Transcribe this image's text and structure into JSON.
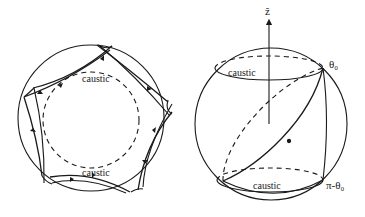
{
  "figure": {
    "left_panel": {
      "description": "Circular billiard with pentagram-like orbit and circular caustic",
      "labels": {
        "caustic_top": "caustic",
        "caustic_bottom": "caustic"
      }
    },
    "right_panel": {
      "description": "Sphere with great-circle orbit between two latitude caustics",
      "labels": {
        "axis": "ẑ",
        "theta_top": "θ₀",
        "caustic_top": "caustic",
        "caustic_bottom": "caustic",
        "theta_bottom": "π-θ₀"
      }
    },
    "colors": {
      "stroke": "#1a1a1a",
      "background": "#ffffff"
    }
  }
}
